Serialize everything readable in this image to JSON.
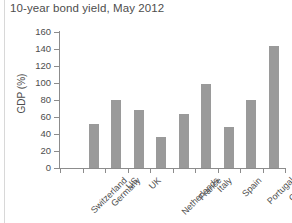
{
  "chart_data": {
    "type": "bar",
    "title": "10-year bond yield, May 2012",
    "xlabel": "",
    "ylabel": "GDP (%)",
    "ylim": [
      0,
      160
    ],
    "yticks": [
      0,
      20,
      40,
      60,
      80,
      100,
      120,
      140,
      160
    ],
    "grid": false,
    "legend": false,
    "bar_color": "#9a9a9a",
    "categories": [
      "Switzerland",
      "Germany",
      "US",
      "UK",
      "Netherlands",
      "France",
      "Italy",
      "Spain",
      "Portugal",
      "Greece"
    ],
    "values": [
      0,
      52,
      80,
      68,
      37,
      64,
      99,
      48,
      80,
      143
    ]
  }
}
